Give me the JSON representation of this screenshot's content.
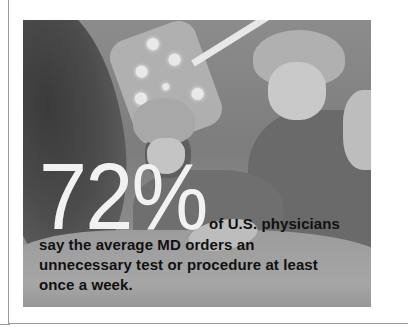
{
  "graphic": {
    "photo_description": "grayscale-surgeons-operating-room",
    "statistic": {
      "value": "72%",
      "lead": "of U.S. physicians",
      "lines": [
        "say the average MD orders an",
        "unnecessary test or procedure at least",
        "once a week."
      ]
    },
    "colors": {
      "number": "#f2f2f2",
      "text": "#111111",
      "border": "#9a9a9a",
      "background": "#ffffff"
    }
  }
}
